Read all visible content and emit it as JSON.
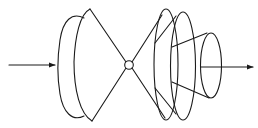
{
  "diagram": {
    "type": "beam-propagation-schematic",
    "colors": {
      "line": "#1a1a1a",
      "background": "#ffffff"
    },
    "elements": [
      {
        "id": "input-arrow",
        "kind": "arrow",
        "from": [
          9,
          65
        ],
        "to": [
          55,
          65
        ]
      },
      {
        "id": "left-lens-outer",
        "kind": "half-ellipse",
        "cx": 75,
        "top": 16,
        "bottom": 118
      },
      {
        "id": "left-cone-base",
        "kind": "half-ellipse",
        "cx": 90,
        "top": 9,
        "bottom": 121
      },
      {
        "id": "focal-point",
        "kind": "circle",
        "cx": 129,
        "cy": 65,
        "r": 4.5
      },
      {
        "id": "right-cone-1",
        "kind": "ellipse",
        "cx": 166,
        "top": 9,
        "bottom": 120
      },
      {
        "id": "right-cone-2",
        "kind": "ellipse",
        "cx": 183,
        "top": 12,
        "bottom": 120
      },
      {
        "id": "output-cone",
        "kind": "ellipse",
        "cx": 211,
        "top": 33,
        "bottom": 98
      },
      {
        "id": "output-arrow",
        "kind": "arrow",
        "from": [
          201,
          67
        ],
        "to": [
          256,
          67
        ]
      }
    ],
    "labels": []
  }
}
